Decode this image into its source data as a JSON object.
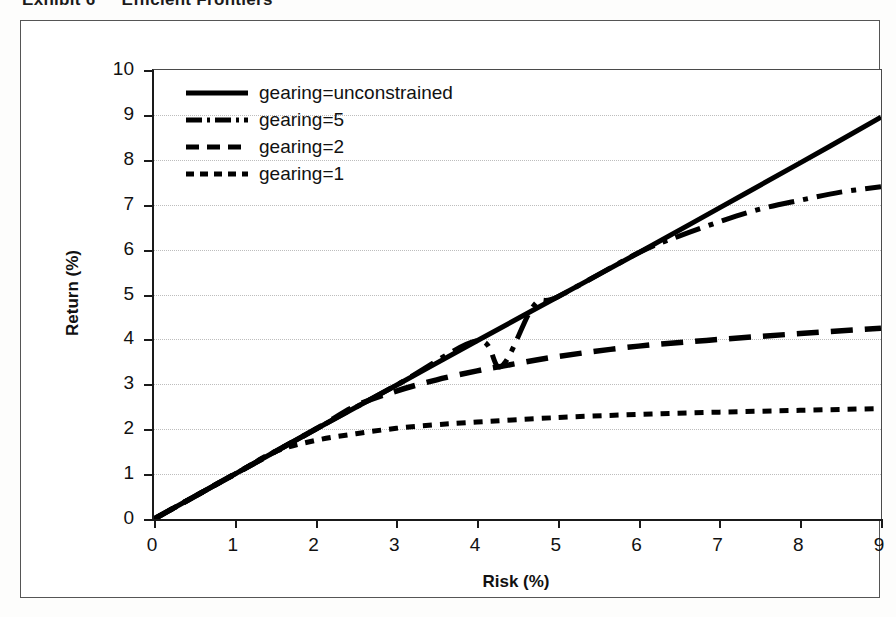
{
  "exhibit": {
    "label": "Exhibit 6",
    "title": "Efficient Frontiers"
  },
  "chart_data": {
    "type": "line",
    "title": "Efficient Frontiers",
    "xlabel": "Risk (%)",
    "ylabel": "Return (%)",
    "xlim": [
      0,
      9
    ],
    "ylim": [
      0,
      10
    ],
    "xticks": [
      "0",
      "1",
      "2",
      "3",
      "4",
      "5",
      "6",
      "7",
      "8",
      "9"
    ],
    "yticks": [
      "0",
      "1",
      "2",
      "3",
      "4",
      "5",
      "6",
      "7",
      "8",
      "9",
      "10"
    ],
    "grid": "horizontal-dotted",
    "legend_position": "top-left-inside",
    "series": [
      {
        "name": "gearing=unconstrained",
        "style": "solid",
        "x": [
          0,
          1,
          2,
          3,
          4,
          5,
          6,
          7,
          8,
          9
        ],
        "y": [
          0.0,
          1.0,
          2.0,
          2.98,
          3.97,
          4.95,
          5.93,
          6.93,
          7.93,
          8.95
        ]
      },
      {
        "name": "gearing=5",
        "style": "dash-dot",
        "x": [
          0,
          1,
          2,
          3,
          4,
          4.3,
          4.7,
          5,
          6,
          6.5,
          7,
          7.5,
          8,
          8.5,
          9
        ],
        "y": [
          0.0,
          1.0,
          2.0,
          2.98,
          3.97,
          3.4,
          4.75,
          4.95,
          5.93,
          6.3,
          6.62,
          6.9,
          7.1,
          7.28,
          7.4
        ]
      },
      {
        "name": "gearing=2",
        "style": "long-dash",
        "x": [
          0,
          1,
          2,
          2.5,
          3,
          3.5,
          4,
          4.3,
          5,
          6,
          7,
          8,
          9
        ],
        "y": [
          0.0,
          1.0,
          2.0,
          2.52,
          2.85,
          3.1,
          3.3,
          3.4,
          3.62,
          3.85,
          4.0,
          4.13,
          4.25
        ]
      },
      {
        "name": "gearing=1",
        "style": "short-dash",
        "x": [
          0,
          1,
          1.5,
          2,
          2.5,
          3,
          3.5,
          4,
          5,
          6,
          7,
          8,
          9
        ],
        "y": [
          0.0,
          1.0,
          1.5,
          1.75,
          1.9,
          2.02,
          2.1,
          2.16,
          2.26,
          2.33,
          2.38,
          2.42,
          2.46
        ]
      }
    ]
  },
  "legend": {
    "items": [
      {
        "label": "gearing=unconstrained",
        "style": "solid"
      },
      {
        "label": "gearing=5",
        "style": "dash-dot"
      },
      {
        "label": "gearing=2",
        "style": "long-dash"
      },
      {
        "label": "gearing=1",
        "style": "short-dash"
      }
    ]
  }
}
